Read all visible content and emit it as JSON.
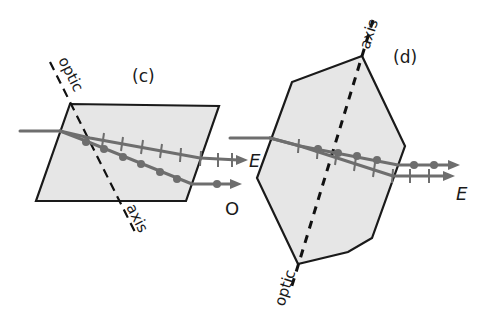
{
  "panels": {
    "c": {
      "label": "(c)",
      "axis_text_top": "optic",
      "axis_text_bottom": "axis",
      "ray_labels": {
        "extraordinary": "",
        "ordinary": "O"
      }
    },
    "d": {
      "label": "(d)",
      "axis_text_top": "axis",
      "axis_text_bottom": "optic",
      "ray_labels": {
        "incoming": "E",
        "exit": "E"
      }
    }
  },
  "colors": {
    "crystal_fill": "#e6e6e6",
    "outline": "#1a1a1a",
    "ray": "#6e6e6e"
  }
}
